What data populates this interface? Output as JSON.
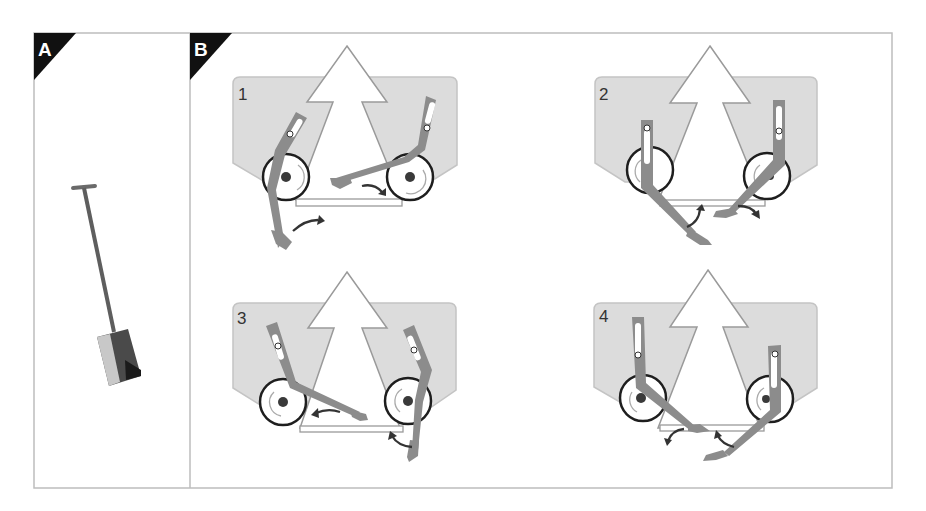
{
  "figure": {
    "panels": [
      {
        "id": "A",
        "letter": "A",
        "content": "spade-icon"
      },
      {
        "id": "B",
        "letter": "B",
        "steps": [
          {
            "label": "1"
          },
          {
            "label": "2"
          },
          {
            "label": "3"
          },
          {
            "label": "4"
          }
        ]
      }
    ],
    "colors": {
      "frame": "#bdbdbd",
      "body_fill": "#dcdcdc",
      "body_stroke": "#c4c4c4",
      "arm": "#8c8c8c",
      "wheel_stroke": "#1e1e1e",
      "hub": "#3a3a3a",
      "motion_arrow": "#333333",
      "corner_tag": "#111111"
    }
  }
}
